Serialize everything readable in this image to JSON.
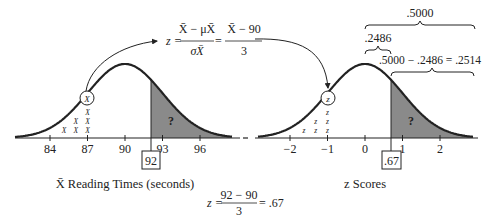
{
  "chart_data": {
    "type": "diagram",
    "title": "",
    "panels": [
      {
        "name": "sample-mean-distribution",
        "xlabel": "X̄ Reading Times (seconds)",
        "tick_labels": [
          "84",
          "87",
          "90",
          "93",
          "96"
        ],
        "tick_values": [
          84,
          87,
          90,
          93,
          96
        ],
        "mean": 90,
        "std_error": 3,
        "marked_value": "92",
        "circled_symbol": "X",
        "hatch_symbol": "X",
        "shaded_region_label": "?"
      },
      {
        "name": "z-score-distribution",
        "xlabel": "z Scores",
        "tick_labels": [
          "−2",
          "−1",
          "0",
          "1",
          "2"
        ],
        "tick_values": [
          -2,
          -1,
          0,
          1,
          2
        ],
        "marked_value": ".67",
        "circled_symbol": "z",
        "hatch_symbol": "z",
        "shaded_region_label": "?",
        "brace_labels": {
          "half": ".5000",
          "center_to_z": ".2486",
          "tail": ".5000 − .2486 = .2514"
        }
      }
    ],
    "formulas": {
      "top": {
        "lhs": "z =",
        "frac1_num": "X̄ − μX̄",
        "frac1_den": "σX̄",
        "eq": "=",
        "frac2_num": "X̄ − 90",
        "frac2_den": "3"
      },
      "bottom": {
        "lhs": "z =",
        "num": "92 − 90",
        "den": "3",
        "rhs": "= .67"
      }
    }
  }
}
